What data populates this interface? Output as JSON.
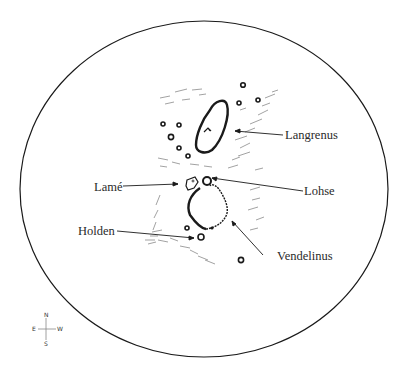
{
  "labels": {
    "langrenus": "Langrenus",
    "lame": "Lamé",
    "lohse": "Lohse",
    "holden": "Holden",
    "vendelinus": "Vendelinus"
  },
  "compass": {
    "north": "N",
    "south": "S",
    "east": "E",
    "west": "W"
  },
  "colors": {
    "ink": "#1a1a1a",
    "hatch": "#8a8a8a",
    "background": "#ffffff"
  }
}
